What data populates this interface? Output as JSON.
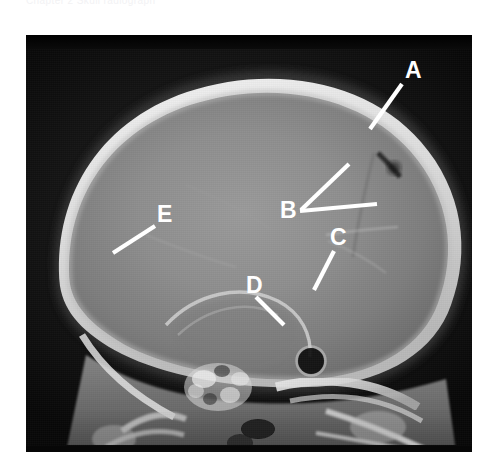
{
  "header": {
    "clipped_text": "Chapter 2 Skull radiograph"
  },
  "image": {
    "kind": "skull-lateral-radiograph",
    "modality": "X-ray",
    "projection": "lateral",
    "frame": {
      "x": 26,
      "y": 35,
      "width": 446,
      "height": 417
    },
    "background_color": "#0a0a0a",
    "marker_color": "#ffffff"
  },
  "markers": [
    {
      "id": "A",
      "label": "A",
      "label_x": 405,
      "label_y": 78,
      "lines": [
        {
          "x1": 402,
          "y1": 84,
          "x2": 370,
          "y2": 129
        }
      ]
    },
    {
      "id": "B",
      "label": "B",
      "label_x": 280,
      "label_y": 218,
      "lines": [
        {
          "x1": 301,
          "y1": 210,
          "x2": 349,
          "y2": 164
        },
        {
          "x1": 300,
          "y1": 211,
          "x2": 377,
          "y2": 204
        }
      ]
    },
    {
      "id": "C",
      "label": "C",
      "label_x": 330,
      "label_y": 245,
      "lines": [
        {
          "x1": 334,
          "y1": 251,
          "x2": 314,
          "y2": 290
        }
      ]
    },
    {
      "id": "D",
      "label": "D",
      "label_x": 246,
      "label_y": 293,
      "lines": [
        {
          "x1": 256,
          "y1": 297,
          "x2": 284,
          "y2": 325
        }
      ]
    },
    {
      "id": "E",
      "label": "E",
      "label_x": 157,
      "label_y": 222,
      "lines": [
        {
          "x1": 155,
          "y1": 226,
          "x2": 113,
          "y2": 253
        }
      ]
    }
  ]
}
